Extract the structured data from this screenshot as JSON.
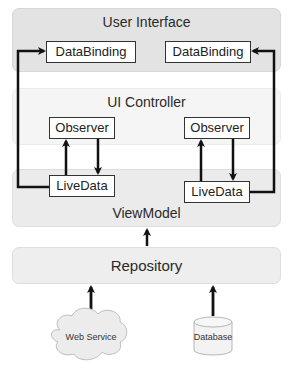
{
  "diagram": {
    "layers": {
      "user_interface": {
        "title": "User Interface",
        "fill": "#e3e3e3"
      },
      "ui_controller": {
        "title": "UI Controller",
        "fill": "#f5f5f5"
      },
      "view_model": {
        "title": "ViewModel",
        "fill": "#ebebeb"
      },
      "repository": {
        "title": "Repository",
        "fill": "#eeeeee"
      }
    },
    "nodes": {
      "databinding_left": "DataBinding",
      "databinding_right": "DataBinding",
      "observer_left": "Observer",
      "observer_right": "Observer",
      "livedata_left": "LiveData",
      "livedata_right": "LiveData",
      "web_service": "Web Service",
      "database": "Database"
    },
    "edges": [
      {
        "from": "livedata_left",
        "to": "databinding_left"
      },
      {
        "from": "livedata_right",
        "to": "databinding_right"
      },
      {
        "from": "livedata_left",
        "to": "observer_left"
      },
      {
        "from": "observer_left",
        "to": "livedata_left"
      },
      {
        "from": "livedata_right",
        "to": "observer_right"
      },
      {
        "from": "observer_right",
        "to": "livedata_right"
      },
      {
        "from": "repository",
        "to": "view_model"
      },
      {
        "from": "web_service",
        "to": "repository"
      },
      {
        "from": "database",
        "to": "repository"
      }
    ]
  }
}
